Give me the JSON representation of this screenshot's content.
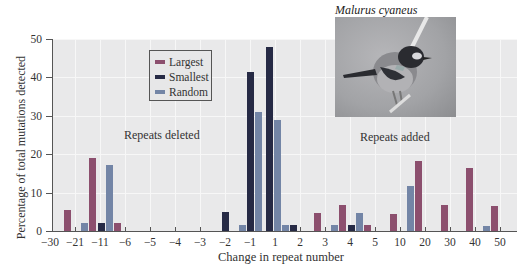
{
  "photo": {
    "caption": "Malurus cyaneus",
    "subject": "superb-fairywren-bird-photo"
  },
  "annotations": {
    "deleted": "Repeats deleted",
    "added": "Repeats added"
  },
  "colors": {
    "largest": "#8c4f6e",
    "smallest": "#262a45",
    "random": "#7385a6",
    "plot_bg": "#e9e9ea"
  },
  "chart_data": {
    "type": "bar",
    "title": "",
    "xlabel": "Change in repeat number",
    "ylabel": "Percentage of total mutations detected",
    "ylim": [
      0,
      50
    ],
    "yticks": [
      "0",
      "10",
      "20",
      "30",
      "40",
      "50"
    ],
    "xticks": [
      "−30",
      "−21",
      "−11",
      "−6",
      "−5",
      "−4",
      "−3",
      "−2",
      "−1",
      "1",
      "2",
      "3",
      "4",
      "5",
      "10",
      "20",
      "30",
      "40",
      "50"
    ],
    "grid": true,
    "legend": {
      "position": "upper-left-inside",
      "entries": [
        "Largest",
        "Smallest",
        "Random"
      ]
    },
    "categories": [
      "−30 to −21",
      "−21 to −11",
      "−11 to −6",
      "−3 to −2",
      "−2 to −1",
      "−1 to 1",
      "1 to 2",
      "2 to 3",
      "3 to 4",
      "4 to 5",
      "5 to 10",
      "10 to 20",
      "20 to 30",
      "30 to 40",
      "40 to 50"
    ],
    "series": [
      {
        "name": "Largest",
        "values": [
          5.5,
          19,
          2,
          0,
          0,
          0,
          0,
          4.7,
          6.7,
          1.5,
          4.5,
          18.3,
          6.7,
          16.5,
          6.4
        ]
      },
      {
        "name": "Smallest",
        "values": [
          0,
          0,
          2,
          5,
          41.3,
          48,
          1.5,
          0,
          1.5,
          0,
          0,
          0,
          0,
          0,
          0
        ]
      },
      {
        "name": "Random",
        "values": [
          0,
          2,
          17.3,
          0,
          1.5,
          31,
          29,
          1.5,
          4.7,
          0,
          0,
          11.8,
          0,
          0,
          1.3
        ]
      }
    ],
    "bars": [
      {
        "x": 64,
        "v": 5.5,
        "s": "largest"
      },
      {
        "x": 81,
        "v": 2,
        "s": "random"
      },
      {
        "x": 89,
        "v": 19,
        "s": "largest"
      },
      {
        "x": 98,
        "v": 2,
        "s": "smallest"
      },
      {
        "x": 106,
        "v": 17.3,
        "s": "random"
      },
      {
        "x": 114,
        "v": 2,
        "s": "largest"
      },
      {
        "x": 222,
        "v": 5,
        "s": "smallest"
      },
      {
        "x": 239,
        "v": 1.5,
        "s": "random"
      },
      {
        "x": 247,
        "v": 41.3,
        "s": "smallest"
      },
      {
        "x": 255,
        "v": 31,
        "s": "random"
      },
      {
        "x": 266,
        "v": 48,
        "s": "smallest"
      },
      {
        "x": 274,
        "v": 29,
        "s": "random"
      },
      {
        "x": 282,
        "v": 1.5,
        "s": "random"
      },
      {
        "x": 290,
        "v": 1.5,
        "s": "smallest"
      },
      {
        "x": 314,
        "v": 4.7,
        "s": "largest"
      },
      {
        "x": 331,
        "v": 1.5,
        "s": "random"
      },
      {
        "x": 339,
        "v": 6.7,
        "s": "largest"
      },
      {
        "x": 348,
        "v": 1.5,
        "s": "smallest"
      },
      {
        "x": 356,
        "v": 4.7,
        "s": "random"
      },
      {
        "x": 364,
        "v": 1.5,
        "s": "largest"
      },
      {
        "x": 390,
        "v": 4.5,
        "s": "largest"
      },
      {
        "x": 407,
        "v": 11.8,
        "s": "random"
      },
      {
        "x": 415,
        "v": 18.3,
        "s": "largest"
      },
      {
        "x": 441,
        "v": 6.7,
        "s": "largest"
      },
      {
        "x": 466,
        "v": 16.5,
        "s": "largest"
      },
      {
        "x": 483,
        "v": 1.3,
        "s": "random"
      },
      {
        "x": 491,
        "v": 6.4,
        "s": "largest"
      }
    ]
  }
}
